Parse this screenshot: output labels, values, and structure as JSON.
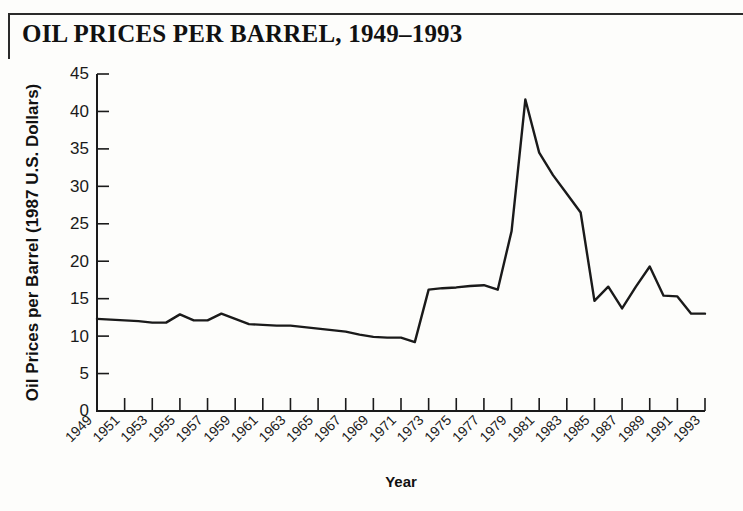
{
  "figure": {
    "title_full": "OIL PRICES PER BARREL, 1949–1993",
    "title_parts": {
      "word1_cap": "O",
      "word1_rest": "IL",
      "word2_cap": "P",
      "word2_rest": "RICES",
      "word3_cap": "",
      "word3_rest": "PER",
      "word4_cap": "B",
      "word4_rest": "ARREL",
      "range": ", 1949–1993"
    }
  },
  "chart_data": {
    "type": "line",
    "title": "Oil Prices per Barrel, 1949–1993",
    "xlabel": "Year",
    "ylabel": "Oil Prices per Barrel (1987 U.S. Dollars)",
    "xlim": [
      1949,
      1993
    ],
    "ylim": [
      0,
      45
    ],
    "yticks": [
      0,
      5,
      10,
      15,
      20,
      25,
      30,
      35,
      40,
      45
    ],
    "ytick_labels": [
      "0",
      "5",
      "10",
      "15",
      "20",
      "25",
      "30",
      "35",
      "40",
      "45"
    ],
    "xticks": [
      1949,
      1951,
      1953,
      1955,
      1957,
      1959,
      1961,
      1963,
      1965,
      1967,
      1969,
      1971,
      1973,
      1975,
      1977,
      1979,
      1981,
      1983,
      1985,
      1987,
      1989,
      1991,
      1993
    ],
    "xtick_labels": [
      "1949",
      "1951",
      "1953",
      "1955",
      "1957",
      "1959",
      "1961",
      "1963",
      "1965",
      "1967",
      "1969",
      "1971",
      "1973",
      "1975",
      "1977",
      "1979",
      "1981",
      "1983",
      "1985",
      "1987",
      "1989",
      "1991",
      "1993"
    ],
    "xtick_rotation": 45,
    "grid": false,
    "legend": false,
    "line_color": "#1a1a1a",
    "x": [
      1949,
      1950,
      1951,
      1952,
      1953,
      1954,
      1955,
      1956,
      1957,
      1958,
      1959,
      1960,
      1961,
      1962,
      1963,
      1964,
      1965,
      1966,
      1967,
      1968,
      1969,
      1970,
      1971,
      1972,
      1973,
      1974,
      1975,
      1976,
      1977,
      1978,
      1979,
      1980,
      1981,
      1982,
      1983,
      1984,
      1985,
      1986,
      1987,
      1988,
      1989,
      1990,
      1991,
      1992,
      1993
    ],
    "values": [
      12.3,
      12.2,
      12.1,
      12.0,
      11.8,
      11.8,
      12.9,
      12.1,
      12.1,
      13.0,
      12.3,
      11.6,
      11.5,
      11.4,
      11.4,
      11.2,
      11.0,
      10.8,
      10.6,
      10.2,
      9.9,
      9.8,
      9.8,
      9.2,
      16.2,
      16.4,
      16.5,
      16.7,
      16.8,
      16.2,
      24.0,
      41.6,
      34.5,
      31.5,
      29.0,
      26.5,
      14.7,
      16.6,
      13.7,
      16.6,
      19.3,
      15.4,
      15.3,
      13.0,
      13.0
    ],
    "annotations": [
      {
        "label": "peak",
        "x": 1981,
        "y": 41.6
      },
      {
        "label": "low",
        "x": 1972,
        "y": 9.2
      }
    ]
  },
  "axes": {
    "y_axis_title": "Oil Prices per Barrel (1987 U.S. Dollars)",
    "x_axis_title": "Year"
  }
}
